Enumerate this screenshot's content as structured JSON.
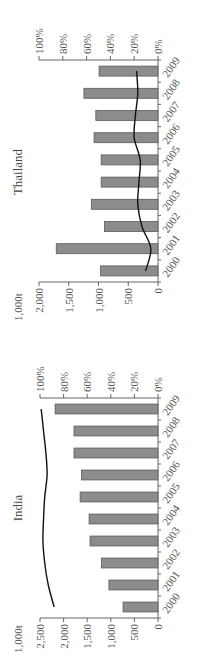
{
  "chart_data": [
    {
      "type": "bar",
      "title": "India",
      "unit_label": "1,000t",
      "categories": [
        "2000",
        "2001",
        "2002",
        "2003",
        "2004",
        "2005",
        "2006",
        "2007",
        "2008",
        "2009"
      ],
      "series": [
        {
          "name": "Volume (1,000t)",
          "type": "bar",
          "axis": "left",
          "values": [
            740,
            1040,
            1200,
            1440,
            1460,
            1650,
            1620,
            1780,
            1780,
            2180
          ]
        },
        {
          "name": "Share (%)",
          "type": "line",
          "axis": "right",
          "values": [
            88,
            93,
            96,
            97.5,
            97,
            96,
            94,
            95,
            97,
            99
          ]
        }
      ],
      "left_axis": {
        "ylim": [
          0,
          2500
        ],
        "ticks": [
          0,
          500,
          1000,
          1500,
          2000,
          2500
        ],
        "tick_labels": [
          "0",
          "500",
          "1,000",
          "1,500",
          "2,000",
          "2,500"
        ]
      },
      "right_axis": {
        "ylim": [
          0,
          100
        ],
        "ticks": [
          0,
          20,
          40,
          60,
          80,
          100
        ],
        "tick_labels": [
          "0%",
          "20%",
          "40%",
          "60%",
          "80%",
          "100%"
        ]
      },
      "orientation": "rotated-90-ccw"
    },
    {
      "type": "bar",
      "title": "Thailand",
      "unit_label": "1,000t",
      "categories": [
        "2000",
        "2001",
        "2002",
        "2003",
        "2004",
        "2005",
        "2006",
        "2007",
        "2008",
        "2009"
      ],
      "series": [
        {
          "name": "Volume (1,000t)",
          "type": "bar",
          "axis": "left",
          "values": [
            965,
            1710,
            900,
            1120,
            955,
            955,
            1075,
            1045,
            1245,
            990
          ]
        },
        {
          "name": "Share (%)",
          "type": "line",
          "axis": "right",
          "values": [
            10.5,
            6,
            13.5,
            17,
            16,
            15,
            20,
            19,
            17,
            18
          ]
        }
      ],
      "left_axis": {
        "ylim": [
          0,
          2000
        ],
        "ticks": [
          0,
          500,
          1000,
          1500,
          2000
        ],
        "tick_labels": [
          "0",
          "500",
          "1,000",
          "1,500",
          "2,000"
        ]
      },
      "right_axis": {
        "ylim": [
          0,
          100
        ],
        "ticks": [
          0,
          20,
          40,
          60,
          80,
          100
        ],
        "tick_labels": [
          "0%",
          "20%",
          "40%",
          "60%",
          "80%",
          "100%"
        ]
      },
      "orientation": "rotated-90-ccw"
    }
  ]
}
